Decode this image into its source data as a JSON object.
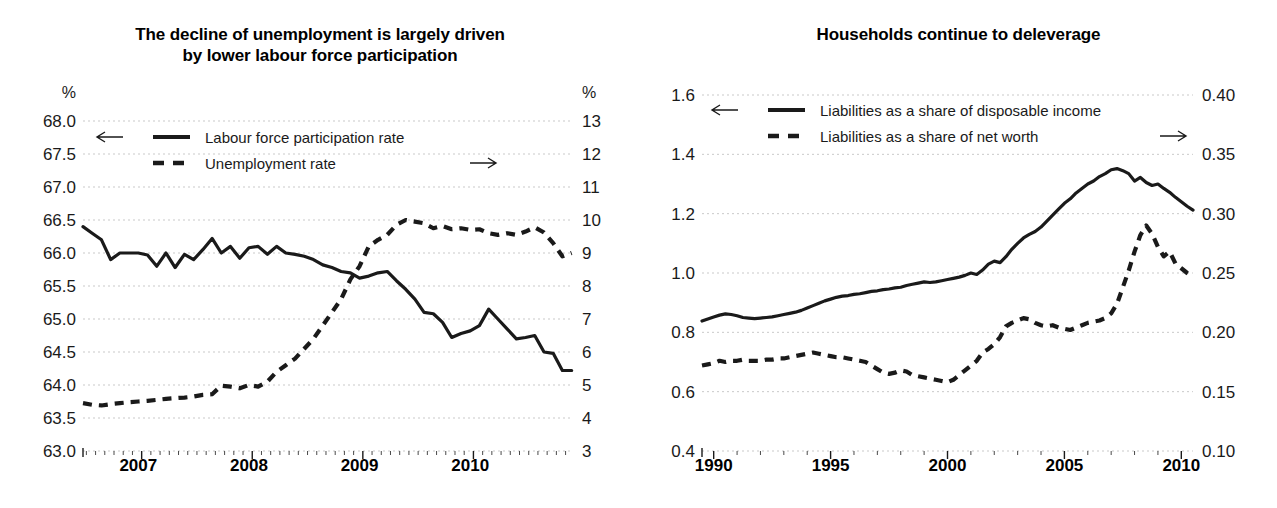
{
  "chart_data": [
    {
      "type": "line",
      "panel": "left",
      "title": "The decline of unemployment is largely driven by lower labour force participation",
      "title_line1": "The decline of unemployment is largely driven",
      "title_line2": "by lower labour force participation",
      "left_axis_unit": "%",
      "right_axis_unit": "%",
      "xlabel": "",
      "ylabel": "%",
      "grid": true,
      "legend_position": "top-left",
      "left_axis": {
        "label": "%",
        "ylim": [
          63.0,
          68.0
        ],
        "ticks": [
          "68.0",
          "67.5",
          "67.0",
          "66.5",
          "66.0",
          "65.5",
          "65.0",
          "64.5",
          "64.0",
          "63.5",
          "63.0"
        ],
        "tick_values": [
          68.0,
          67.5,
          67.0,
          66.5,
          66.0,
          65.5,
          65.0,
          64.5,
          64.0,
          63.5,
          63.0
        ],
        "arrow": "left-arrow"
      },
      "right_axis": {
        "label": "%",
        "ylim": [
          3,
          13
        ],
        "ticks": [
          "13",
          "12",
          "11",
          "10",
          "9",
          "8",
          "7",
          "6",
          "5",
          "4",
          "3"
        ],
        "tick_values": [
          13,
          12,
          11,
          10,
          9,
          8,
          7,
          6,
          5,
          4,
          3
        ],
        "arrow": "right-arrow"
      },
      "x_tick_labels": [
        "2007",
        "2008",
        "2009",
        "2010"
      ],
      "x_tick_label_values": [
        2007,
        2008,
        2009,
        2010
      ],
      "x_range": [
        2006.5,
        2010.92
      ],
      "x_minor_step": 0.0833,
      "series": [
        {
          "name": "Labour force participation rate",
          "style": "solid",
          "axis": "left",
          "x": [
            2006.5,
            2006.583,
            2006.667,
            2006.75,
            2006.833,
            2006.917,
            2007.0,
            2007.083,
            2007.167,
            2007.25,
            2007.333,
            2007.417,
            2007.5,
            2007.583,
            2007.667,
            2007.75,
            2007.833,
            2007.917,
            2008.0,
            2008.083,
            2008.167,
            2008.25,
            2008.333,
            2008.417,
            2008.5,
            2008.583,
            2008.667,
            2008.75,
            2008.833,
            2008.917,
            2009.0,
            2009.083,
            2009.167,
            2009.25,
            2009.333,
            2009.417,
            2009.5,
            2009.583,
            2009.667,
            2009.75,
            2009.833,
            2009.917,
            2010.0,
            2010.083,
            2010.167,
            2010.25,
            2010.333,
            2010.417,
            2010.5,
            2010.583,
            2010.667,
            2010.75,
            2010.833,
            2010.917
          ],
          "values": [
            66.4,
            66.3,
            66.2,
            65.9,
            66.0,
            66.0,
            66.0,
            65.97,
            65.8,
            66.0,
            65.78,
            65.98,
            65.9,
            66.05,
            66.22,
            66.0,
            66.1,
            65.92,
            66.08,
            66.1,
            65.98,
            66.1,
            66.0,
            65.98,
            65.95,
            65.9,
            65.82,
            65.78,
            65.72,
            65.7,
            65.62,
            65.65,
            65.7,
            65.72,
            65.58,
            65.45,
            65.3,
            65.1,
            65.08,
            64.95,
            64.72,
            64.78,
            64.82,
            64.9,
            65.15,
            65.0,
            64.85,
            64.7,
            64.72,
            64.75,
            64.5,
            64.48,
            64.22,
            64.22
          ]
        },
        {
          "name": "Unemployment rate",
          "style": "dashed",
          "axis": "right",
          "x": [
            2006.5,
            2006.583,
            2006.667,
            2006.75,
            2006.833,
            2006.917,
            2007.0,
            2007.083,
            2007.167,
            2007.25,
            2007.333,
            2007.417,
            2007.5,
            2007.583,
            2007.667,
            2007.75,
            2007.833,
            2007.917,
            2008.0,
            2008.083,
            2008.167,
            2008.25,
            2008.333,
            2008.417,
            2008.5,
            2008.583,
            2008.667,
            2008.75,
            2008.833,
            2008.917,
            2009.0,
            2009.083,
            2009.167,
            2009.25,
            2009.333,
            2009.417,
            2009.5,
            2009.583,
            2009.667,
            2009.75,
            2009.833,
            2009.917,
            2010.0,
            2010.083,
            2010.167,
            2010.25,
            2010.333,
            2010.417,
            2010.5,
            2010.583,
            2010.667,
            2010.75,
            2010.833,
            2010.917
          ],
          "values": [
            4.45,
            4.4,
            4.38,
            4.42,
            4.45,
            4.48,
            4.5,
            4.52,
            4.55,
            4.58,
            4.6,
            4.62,
            4.65,
            4.7,
            4.72,
            4.98,
            4.95,
            4.9,
            5.0,
            4.95,
            5.1,
            5.4,
            5.6,
            5.8,
            6.1,
            6.4,
            6.8,
            7.2,
            7.6,
            8.2,
            8.6,
            9.2,
            9.4,
            9.55,
            9.85,
            10.0,
            9.95,
            9.9,
            9.75,
            9.82,
            9.72,
            9.75,
            9.7,
            9.72,
            9.6,
            9.55,
            9.6,
            9.55,
            9.65,
            9.78,
            9.62,
            9.3,
            8.9,
            9.0
          ]
        }
      ]
    },
    {
      "type": "line",
      "panel": "right",
      "title": "Households continue to deleverage",
      "title_line1": "Households continue to deleverage",
      "title_line2": "",
      "left_axis_unit": "",
      "right_axis_unit": "",
      "xlabel": "",
      "ylabel": "",
      "grid": true,
      "legend_position": "top-left",
      "left_axis": {
        "label": "",
        "ylim": [
          0.4,
          1.6
        ],
        "ticks": [
          "1.6",
          "1.4",
          "1.2",
          "1.0",
          "0.8",
          "0.6",
          "0.4"
        ],
        "tick_values": [
          1.6,
          1.4,
          1.2,
          1.0,
          0.8,
          0.6,
          0.4
        ],
        "arrow": "left-arrow"
      },
      "right_axis": {
        "label": "",
        "ylim": [
          0.1,
          0.4
        ],
        "ticks": [
          "0.40",
          "0.35",
          "0.30",
          "0.25",
          "0.20",
          "0.15",
          "0.10"
        ],
        "tick_values": [
          0.4,
          0.35,
          0.3,
          0.25,
          0.2,
          0.15,
          0.1
        ],
        "arrow": "right-arrow"
      },
      "x_tick_labels": [
        "1990",
        "1995",
        "2000",
        "2005",
        "2010"
      ],
      "x_tick_label_values": [
        1990,
        1995,
        2000,
        2005,
        2010
      ],
      "x_range": [
        1989.5,
        2010.5
      ],
      "x_minor_step": 1,
      "series": [
        {
          "name": "Liabilities as a share of disposable income",
          "style": "solid",
          "axis": "left",
          "x": [
            1989.5,
            1989.75,
            1990.0,
            1990.25,
            1990.5,
            1990.75,
            1991.0,
            1991.25,
            1991.5,
            1991.75,
            1992.0,
            1992.25,
            1992.5,
            1992.75,
            1993.0,
            1993.25,
            1993.5,
            1993.75,
            1994.0,
            1994.25,
            1994.5,
            1994.75,
            1995.0,
            1995.25,
            1995.5,
            1995.75,
            1996.0,
            1996.25,
            1996.5,
            1996.75,
            1997.0,
            1997.25,
            1997.5,
            1997.75,
            1998.0,
            1998.25,
            1998.5,
            1998.75,
            1999.0,
            1999.25,
            1999.5,
            1999.75,
            2000.0,
            2000.25,
            2000.5,
            2000.75,
            2001.0,
            2001.25,
            2001.5,
            2001.75,
            2002.0,
            2002.25,
            2002.5,
            2002.75,
            2003.0,
            2003.25,
            2003.5,
            2003.75,
            2004.0,
            2004.25,
            2004.5,
            2004.75,
            2005.0,
            2005.25,
            2005.5,
            2005.75,
            2006.0,
            2006.25,
            2006.5,
            2006.75,
            2007.0,
            2007.25,
            2007.5,
            2007.75,
            2008.0,
            2008.25,
            2008.5,
            2008.75,
            2009.0,
            2009.25,
            2009.5,
            2009.75,
            2010.0,
            2010.25,
            2010.5
          ],
          "values": [
            0.838,
            0.845,
            0.852,
            0.858,
            0.862,
            0.86,
            0.856,
            0.85,
            0.848,
            0.846,
            0.848,
            0.85,
            0.852,
            0.856,
            0.86,
            0.864,
            0.868,
            0.874,
            0.882,
            0.89,
            0.898,
            0.906,
            0.912,
            0.918,
            0.922,
            0.924,
            0.928,
            0.93,
            0.934,
            0.938,
            0.94,
            0.944,
            0.946,
            0.95,
            0.952,
            0.958,
            0.962,
            0.966,
            0.97,
            0.968,
            0.97,
            0.974,
            0.978,
            0.982,
            0.986,
            0.992,
            1.0,
            0.995,
            1.01,
            1.03,
            1.04,
            1.035,
            1.055,
            1.08,
            1.1,
            1.118,
            1.13,
            1.14,
            1.155,
            1.175,
            1.195,
            1.215,
            1.235,
            1.25,
            1.27,
            1.285,
            1.3,
            1.31,
            1.325,
            1.335,
            1.348,
            1.352,
            1.345,
            1.335,
            1.31,
            1.322,
            1.305,
            1.295,
            1.3,
            1.285,
            1.272,
            1.255,
            1.24,
            1.225,
            1.212
          ]
        },
        {
          "name": "Liabilities as a share of net worth",
          "style": "dashed",
          "axis": "right",
          "x": [
            1989.5,
            1989.75,
            1990.0,
            1990.25,
            1990.5,
            1990.75,
            1991.0,
            1991.25,
            1991.5,
            1991.75,
            1992.0,
            1992.25,
            1992.5,
            1992.75,
            1993.0,
            1993.25,
            1993.5,
            1993.75,
            1994.0,
            1994.25,
            1994.5,
            1994.75,
            1995.0,
            1995.25,
            1995.5,
            1995.75,
            1996.0,
            1996.25,
            1996.5,
            1996.75,
            1997.0,
            1997.25,
            1997.5,
            1997.75,
            1998.0,
            1998.25,
            1998.5,
            1998.75,
            1999.0,
            1999.25,
            1999.5,
            1999.75,
            2000.0,
            2000.25,
            2000.5,
            2000.75,
            2001.0,
            2001.25,
            2001.5,
            2001.75,
            2002.0,
            2002.25,
            2002.5,
            2002.75,
            2003.0,
            2003.25,
            2003.5,
            2003.75,
            2004.0,
            2004.25,
            2004.5,
            2004.75,
            2005.0,
            2005.25,
            2005.5,
            2005.75,
            2006.0,
            2006.25,
            2006.5,
            2006.75,
            2007.0,
            2007.25,
            2007.5,
            2007.75,
            2008.0,
            2008.25,
            2008.5,
            2008.75,
            2009.0,
            2009.25,
            2009.5,
            2009.75,
            2010.0,
            2010.25,
            2010.5
          ],
          "values": [
            0.172,
            0.173,
            0.174,
            0.176,
            0.175,
            0.176,
            0.176,
            0.177,
            0.176,
            0.176,
            0.176,
            0.177,
            0.177,
            0.178,
            0.178,
            0.179,
            0.18,
            0.181,
            0.182,
            0.183,
            0.182,
            0.181,
            0.18,
            0.179,
            0.179,
            0.178,
            0.177,
            0.176,
            0.175,
            0.172,
            0.169,
            0.166,
            0.165,
            0.166,
            0.168,
            0.167,
            0.164,
            0.163,
            0.162,
            0.161,
            0.16,
            0.159,
            0.158,
            0.16,
            0.164,
            0.168,
            0.172,
            0.176,
            0.183,
            0.186,
            0.19,
            0.196,
            0.205,
            0.208,
            0.21,
            0.212,
            0.211,
            0.208,
            0.206,
            0.205,
            0.206,
            0.204,
            0.203,
            0.202,
            0.204,
            0.206,
            0.208,
            0.209,
            0.21,
            0.212,
            0.216,
            0.224,
            0.238,
            0.252,
            0.268,
            0.282,
            0.29,
            0.283,
            0.272,
            0.264,
            0.268,
            0.258,
            0.254,
            0.25,
            0.247
          ]
        }
      ]
    }
  ],
  "left_panel": {
    "title_line1": "The decline of unemployment is largely driven",
    "title_line2": "by lower labour force participation",
    "left_unit": "%",
    "right_unit": "%",
    "legend": [
      {
        "label": "Labour force participation rate",
        "style": "solid",
        "arrow": "left-arrow"
      },
      {
        "label": "Unemployment rate",
        "style": "dashed",
        "arrow": "right-arrow"
      }
    ]
  },
  "right_panel": {
    "title_line1": "Households continue to deleverage",
    "title_line2": "",
    "left_unit": "",
    "right_unit": "",
    "legend": [
      {
        "label": "Liabilities as a share of disposable income",
        "style": "solid",
        "arrow": "left-arrow"
      },
      {
        "label": "Liabilities as a share of net worth",
        "style": "dashed",
        "arrow": "right-arrow"
      }
    ]
  }
}
